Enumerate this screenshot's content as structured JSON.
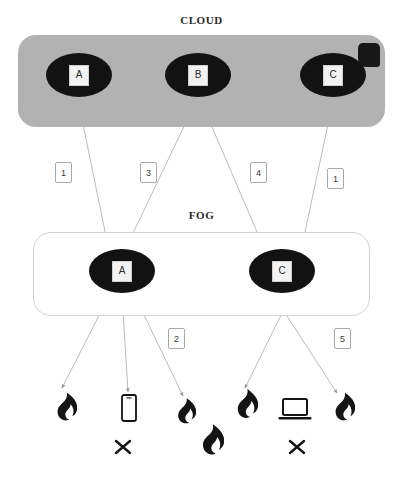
{
  "diagram": {
    "title_cloud": "CLOUD",
    "title_fog": "FOG",
    "colors": {
      "cloud_fill": "#b2b2b2",
      "fog_stroke": "#d2d2d2",
      "node_fill": "#121212",
      "node_label_fill": "#f2f2f2",
      "edge_stroke": "#b9b9b9",
      "icon_fill": "#141414"
    }
  },
  "cloud_nodes": [
    {
      "label": "A",
      "name": "cloud-node-a"
    },
    {
      "label": "B",
      "name": "cloud-node-b"
    },
    {
      "label": "C",
      "name": "cloud-node-c"
    }
  ],
  "fog_nodes": [
    {
      "label": "A",
      "name": "fog-node-a"
    },
    {
      "label": "C",
      "name": "fog-node-c"
    }
  ],
  "edge_labels": [
    {
      "id": "cloud-fog-1",
      "text": "1"
    },
    {
      "id": "cloud-fog-3",
      "text": "3"
    },
    {
      "id": "cloud-fog-4",
      "text": "4"
    },
    {
      "id": "cloud-fog-1b",
      "text": "1"
    },
    {
      "id": "fog-device-2",
      "text": "2"
    },
    {
      "id": "fog-device-5",
      "text": "5"
    }
  ],
  "edges": [
    {
      "from": "cloud-node-a",
      "to": "fog-node-a",
      "label": "1"
    },
    {
      "from": "cloud-node-b",
      "to": "fog-node-a",
      "label": "3"
    },
    {
      "from": "cloud-node-b",
      "to": "fog-node-c",
      "label": "4"
    },
    {
      "from": "cloud-node-c",
      "to": "fog-node-c",
      "label": "1"
    },
    {
      "from": "fog-node-a",
      "to": "device-1",
      "label": ""
    },
    {
      "from": "fog-node-a",
      "to": "device-2",
      "label": ""
    },
    {
      "from": "fog-node-a",
      "to": "device-3",
      "label": "2"
    },
    {
      "from": "fog-node-c",
      "to": "device-4",
      "label": ""
    },
    {
      "from": "fog-node-c",
      "to": "device-6",
      "label": "5"
    }
  ],
  "devices": [
    {
      "name": "device-flame-1",
      "icon": "flame-icon"
    },
    {
      "name": "device-smartphone",
      "icon": "smartphone-icon"
    },
    {
      "name": "device-flame-2",
      "icon": "flame-icon"
    },
    {
      "name": "device-flame-3",
      "icon": "flame-icon"
    },
    {
      "name": "device-laptop",
      "icon": "laptop-icon"
    },
    {
      "name": "device-flame-4",
      "icon": "flame-icon"
    }
  ],
  "bottom_marks": [
    {
      "name": "mark-x-1",
      "icon": "x-mark-icon"
    },
    {
      "name": "mark-flame",
      "icon": "flame-icon"
    },
    {
      "name": "mark-x-2",
      "icon": "x-mark-icon"
    }
  ]
}
